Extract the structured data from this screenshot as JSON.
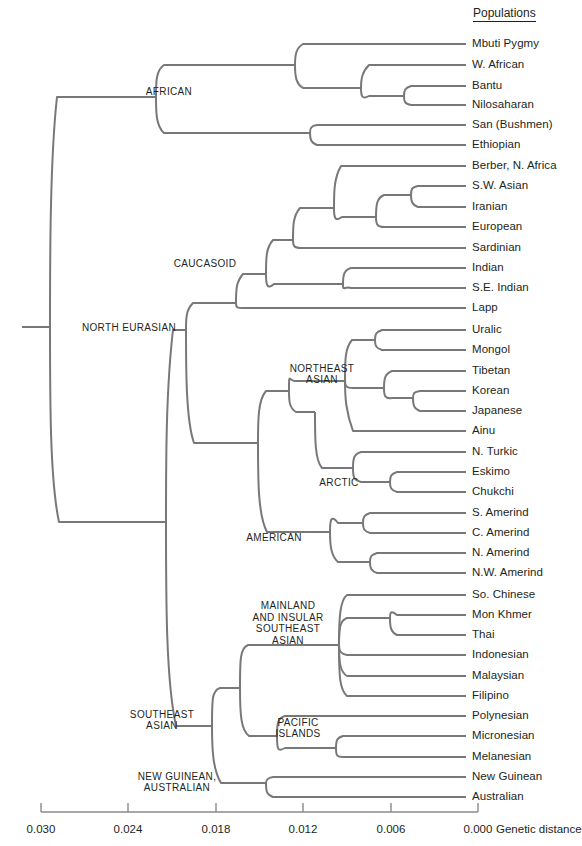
{
  "header": {
    "populations_title": "Populations"
  },
  "axis": {
    "caption": "Genetic distance",
    "ticks": [
      {
        "label": "0.030",
        "value": 0.03,
        "x": 41
      },
      {
        "label": "0.024",
        "value": 0.024,
        "x": 128
      },
      {
        "label": "0.018",
        "value": 0.018,
        "x": 216
      },
      {
        "label": "0.012",
        "value": 0.012,
        "x": 303
      },
      {
        "label": "0.006",
        "value": 0.006,
        "x": 391
      },
      {
        "label": "0.000",
        "value": 0.0,
        "x": 478
      }
    ],
    "range": [
      0.03,
      0.0
    ],
    "y": 812
  },
  "populations": [
    {
      "name": "Mbuti Pygmy",
      "y": 44,
      "tip_x": 466
    },
    {
      "name": "W. African",
      "y": 65,
      "tip_x": 466
    },
    {
      "name": "Bantu",
      "y": 86,
      "tip_x": 466
    },
    {
      "name": "Nilosaharan",
      "y": 105,
      "tip_x": 466
    },
    {
      "name": "San (Bushmen)",
      "y": 125,
      "tip_x": 466
    },
    {
      "name": "Ethiopian",
      "y": 145,
      "tip_x": 466
    },
    {
      "name": "Berber, N. Africa",
      "y": 166,
      "tip_x": 466
    },
    {
      "name": "S.W. Asian",
      "y": 186,
      "tip_x": 466
    },
    {
      "name": "Iranian",
      "y": 207,
      "tip_x": 466
    },
    {
      "name": "European",
      "y": 227,
      "tip_x": 466
    },
    {
      "name": "Sardinian",
      "y": 248,
      "tip_x": 466
    },
    {
      "name": "Indian",
      "y": 268,
      "tip_x": 466
    },
    {
      "name": "S.E. Indian",
      "y": 288,
      "tip_x": 466
    },
    {
      "name": "Lapp",
      "y": 308,
      "tip_x": 466
    },
    {
      "name": "Uralic",
      "y": 330,
      "tip_x": 466
    },
    {
      "name": "Mongol",
      "y": 350,
      "tip_x": 466
    },
    {
      "name": "Tibetan",
      "y": 371,
      "tip_x": 466
    },
    {
      "name": "Korean",
      "y": 391,
      "tip_x": 466
    },
    {
      "name": "Japanese",
      "y": 411,
      "tip_x": 466
    },
    {
      "name": "Ainu",
      "y": 431,
      "tip_x": 466
    },
    {
      "name": "N. Turkic",
      "y": 452,
      "tip_x": 466
    },
    {
      "name": "Eskimo",
      "y": 472,
      "tip_x": 466
    },
    {
      "name": "Chukchi",
      "y": 492,
      "tip_x": 466
    },
    {
      "name": "S. Amerind",
      "y": 513,
      "tip_x": 466
    },
    {
      "name": "C. Amerind",
      "y": 533,
      "tip_x": 466
    },
    {
      "name": "N. Amerind",
      "y": 553,
      "tip_x": 466
    },
    {
      "name": "N.W. Amerind",
      "y": 573,
      "tip_x": 466
    },
    {
      "name": "So. Chinese",
      "y": 595,
      "tip_x": 466
    },
    {
      "name": "Mon Khmer",
      "y": 615,
      "tip_x": 466
    },
    {
      "name": "Thai",
      "y": 635,
      "tip_x": 466
    },
    {
      "name": "Indonesian",
      "y": 655,
      "tip_x": 466
    },
    {
      "name": "Malaysian",
      "y": 676,
      "tip_x": 466
    },
    {
      "name": "Filipino",
      "y": 696,
      "tip_x": 466
    },
    {
      "name": "Polynesian",
      "y": 716,
      "tip_x": 466
    },
    {
      "name": "Micronesian",
      "y": 736,
      "tip_x": 466
    },
    {
      "name": "Melanesian",
      "y": 757,
      "tip_x": 466
    },
    {
      "name": "New Guinean",
      "y": 777,
      "tip_x": 466
    },
    {
      "name": "Australian",
      "y": 797,
      "tip_x": 466
    }
  ],
  "clades": [
    {
      "name": "AFRICAN",
      "lines": [
        "AFRICAN"
      ],
      "cx": 169,
      "cy": 92
    },
    {
      "name": "CAUCASOID",
      "lines": [
        "CAUCASOID"
      ],
      "cx": 205,
      "cy": 264
    },
    {
      "name": "NORTH EURASIAN",
      "lines": [
        "NORTH EURASIAN"
      ],
      "cx": 129,
      "cy": 328
    },
    {
      "name": "NORTHEAST ASIAN",
      "lines": [
        "NORTHEAST",
        "ASIAN"
      ],
      "cx": 322,
      "cy": 374
    },
    {
      "name": "ARCTIC",
      "lines": [
        "ARCTIC"
      ],
      "cx": 339,
      "cy": 483
    },
    {
      "name": "AMERICAN",
      "lines": [
        "AMERICAN"
      ],
      "cx": 274,
      "cy": 538
    },
    {
      "name": "MAINLAND AND INSULAR SOUTHEAST ASIAN",
      "lines": [
        "MAINLAND",
        "AND INSULAR",
        "SOUTHEAST",
        "ASIAN"
      ],
      "cx": 288,
      "cy": 623
    },
    {
      "name": "PACIFIC ISLANDS",
      "lines": [
        "PACIFIC",
        "ISLANDS"
      ],
      "cx": 298,
      "cy": 728
    },
    {
      "name": "SOUTHEAST ASIAN",
      "lines": [
        "SOUTHEAST",
        "ASIAN"
      ],
      "cx": 162,
      "cy": 720
    },
    {
      "name": "NEW GUINEAN, AUSTRALIAN",
      "lines": [
        "NEW GUINEAN,",
        "AUSTRALIAN"
      ],
      "cx": 177,
      "cy": 782
    }
  ],
  "style": {
    "branch_color": "#78787a",
    "axis_color": "#8a8a8c",
    "text_color": "#231f20",
    "background": "#ffffff"
  },
  "chart_data": {
    "type": "tree",
    "xlabel": "Genetic distance",
    "xlim": [
      0.03,
      0.0
    ],
    "grid": false,
    "legend": "none",
    "axis_ticks": [
      0.03,
      0.024,
      0.018,
      0.012,
      0.006,
      0.0
    ],
    "leaves": [
      "Mbuti Pygmy",
      "W. African",
      "Bantu",
      "Nilosaharan",
      "San (Bushmen)",
      "Ethiopian",
      "Berber, N. Africa",
      "S.W. Asian",
      "Iranian",
      "European",
      "Sardinian",
      "Indian",
      "S.E. Indian",
      "Lapp",
      "Uralic",
      "Mongol",
      "Tibetan",
      "Korean",
      "Japanese",
      "Ainu",
      "N. Turkic",
      "Eskimo",
      "Chukchi",
      "S. Amerind",
      "C. Amerind",
      "N. Amerind",
      "N.W. Amerind",
      "So. Chinese",
      "Mon Khmer",
      "Thai",
      "Indonesian",
      "Malaysian",
      "Filipino",
      "Polynesian",
      "Micronesian",
      "Melanesian",
      "New Guinean",
      "Australian"
    ],
    "internal_nodes": [
      {
        "name": "ROOT",
        "distance": 0.032
      },
      {
        "name": "AFRICAN",
        "distance": 0.0295
      },
      {
        "name": "NORTH EURASIAN",
        "distance": 0.02
      },
      {
        "name": "CAUCASOID",
        "distance": 0.0165
      },
      {
        "name": "NORTHEAST ASIAN",
        "distance": 0.0103
      },
      {
        "name": "ARCTIC",
        "distance": 0.0078
      },
      {
        "name": "AMERICAN",
        "distance": 0.0118
      },
      {
        "name": "SOUTHEAST ASIAN",
        "distance": 0.0185
      },
      {
        "name": "MAINLAND AND INSULAR SOUTHEAST ASIAN",
        "distance": 0.011
      },
      {
        "name": "PACIFIC ISLANDS",
        "distance": 0.012
      },
      {
        "name": "NEW GUINEAN, AUSTRALIAN",
        "distance": 0.014
      }
    ]
  }
}
